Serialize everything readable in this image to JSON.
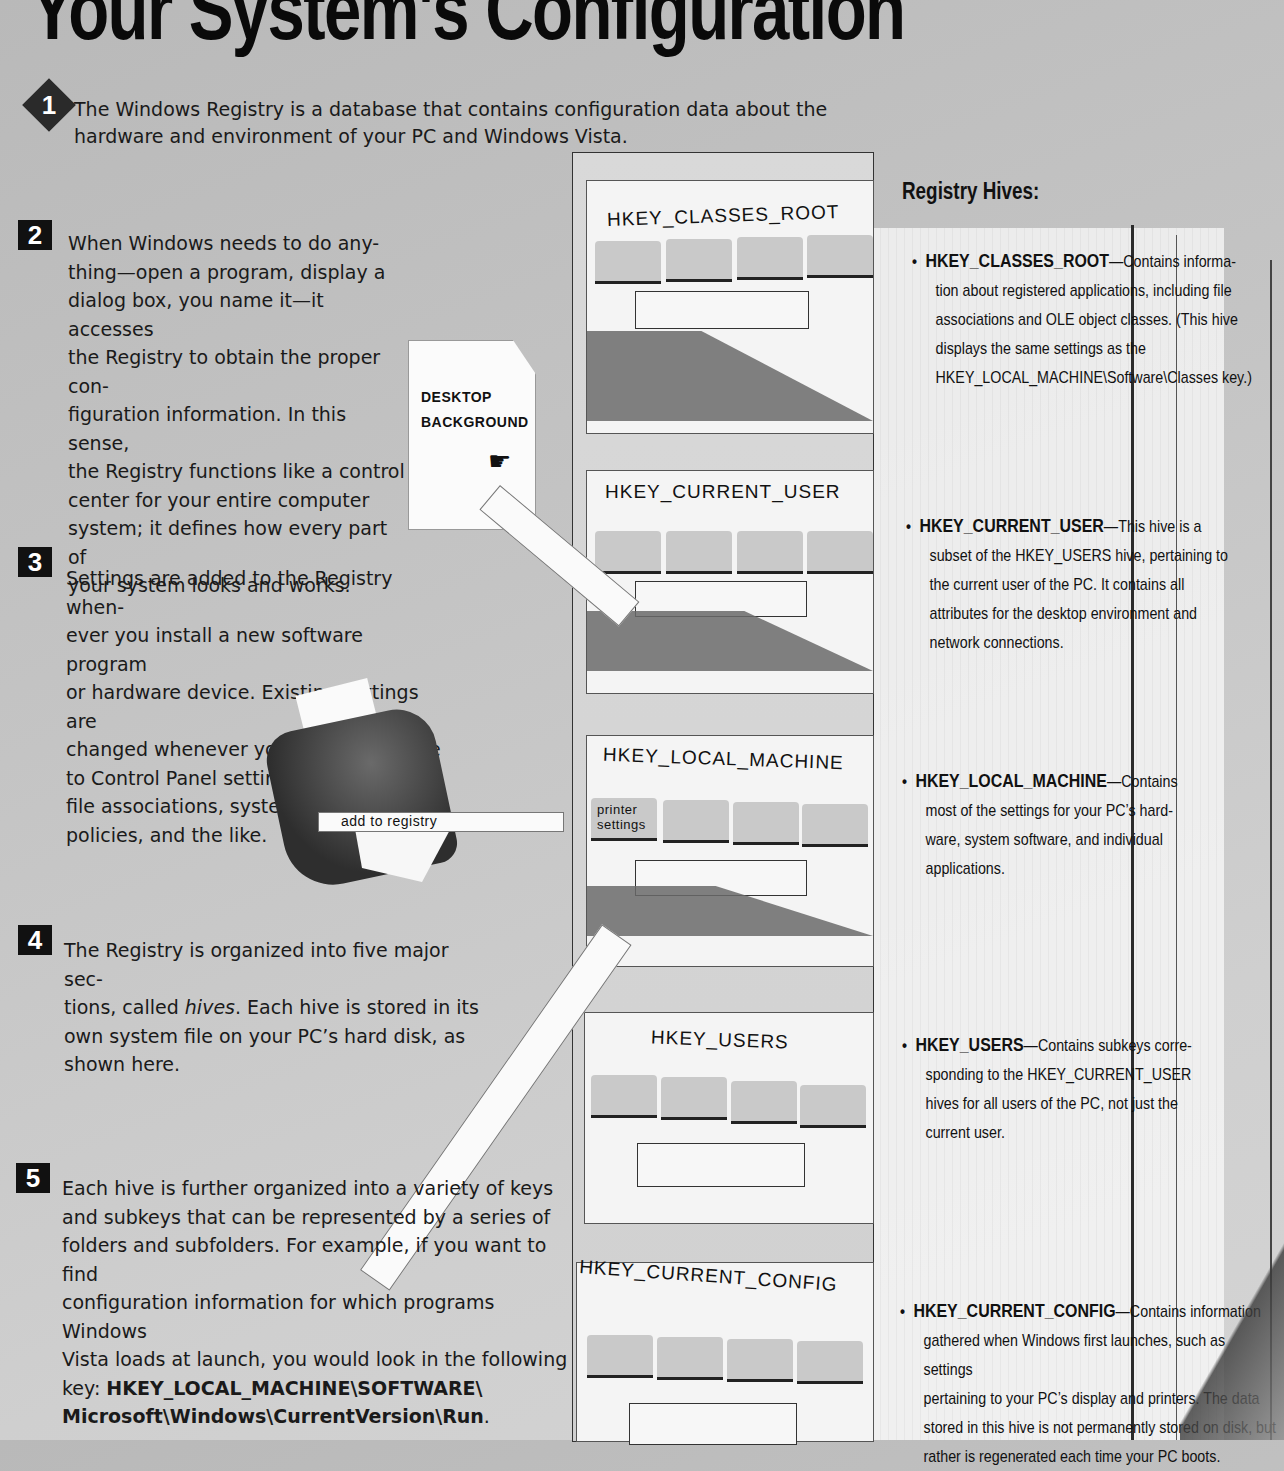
{
  "page": {
    "title": "Your System's Configuration"
  },
  "steps": [
    {
      "number": "1",
      "text": "The Windows Registry is a database that contains configuration data about the hardware and environment of your PC and Windows Vista."
    },
    {
      "number": "2",
      "lines": [
        "When Windows needs to do any-",
        "thing—open a program, display a",
        "dialog box, you name it—it accesses",
        "the Registry to obtain the proper con-",
        "figuration information. In this sense,",
        "the Registry functions like a control",
        "center for your entire computer",
        "system; it defines how every part of",
        "your system looks and works."
      ]
    },
    {
      "number": "3",
      "lines": [
        "Settings are added to the Registry when-",
        "ever you install a new software program",
        "or hardware device. Existing settings are",
        "changed whenever you make a change",
        "to Control Panel settings,",
        "file associations, system",
        "policies, and the like."
      ]
    },
    {
      "number": "4",
      "line1": "The Registry is organized into five major sec-",
      "line2_pre": "tions, called ",
      "line2_em": "hives",
      "line2_post": ". Each hive is stored in its",
      "line3": "own system file on your PC’s hard disk, as",
      "line4": "shown here."
    },
    {
      "number": "5",
      "lines": [
        "Each hive is further organized into a variety of keys",
        "and subkeys that can be represented by a series of",
        "folders and subfolders. For example, if you want to find",
        "configuration information for which programs Windows",
        "Vista loads at launch, you would look in the following"
      ],
      "key_prefix": "key: ",
      "key_path_1": "HKEY_LOCAL_MACHINE\\SOFTWARE\\",
      "key_path_2": "Microsoft\\Windows\\CurrentVersion\\Run",
      "key_suffix": "."
    }
  ],
  "illustration": {
    "desktop_note": {
      "line1": "DESKTOP",
      "line2": "BACKGROUND"
    },
    "printer_strip": "add to registry",
    "printer_folder": {
      "line1": "printer",
      "line2": "settings"
    },
    "drawers": [
      {
        "label": "HKEY_CLASSES_ROOT"
      },
      {
        "label": "HKEY_CURRENT_USER"
      },
      {
        "label": "HKEY_LOCAL_MACHINE"
      },
      {
        "label": "HKEY_USERS"
      },
      {
        "label": "HKEY_CURRENT_CONFIG"
      }
    ]
  },
  "hives_panel": {
    "title": "Registry Hives:",
    "items": [
      {
        "key": "HKEY_CLASSES_ROOT",
        "lines": [
          "—Contains informa-",
          "tion about registered applications, including file",
          "associations and OLE object classes. (This hive",
          "displays the same settings as the",
          "HKEY_LOCAL_MACHINE\\Software\\Classes key.)"
        ]
      },
      {
        "key": "HKEY_CURRENT_USER",
        "lines": [
          "—This hive is a",
          "subset of the HKEY_USERS hive, pertaining to",
          "the current user of the PC. It contains all",
          "attributes for the desktop environment and",
          "network connections."
        ]
      },
      {
        "key": "HKEY_LOCAL_MACHINE",
        "lines": [
          "—Contains",
          "most of the settings for your PC’s hard-",
          "ware, system software, and individual",
          "applications."
        ]
      },
      {
        "key": "HKEY_USERS",
        "lines": [
          "—Contains subkeys corre-",
          "sponding to the HKEY_CURRENT_USER",
          "hives for all users of the PC, not just the",
          "current user."
        ]
      },
      {
        "key": "HKEY_CURRENT_CONFIG",
        "lines": [
          "—Contains information",
          "gathered when Windows first launches, such as settings",
          "pertaining to your PC’s display and printers. The data",
          "stored in this hive is not permanently stored on disk, but",
          "rather is regenerated each time your PC boots."
        ]
      }
    ]
  }
}
